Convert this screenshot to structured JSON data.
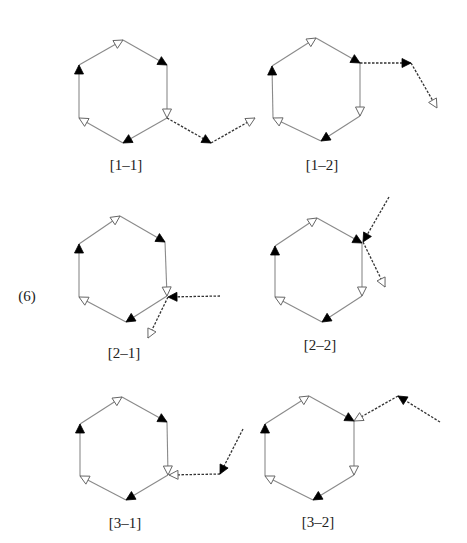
{
  "figure": {
    "equation_number": "(6)",
    "equation_number_pos": [
      27,
      296
    ],
    "colors": {
      "ring_edge": "#8a8a8a",
      "side_chain": "#333333",
      "filled_arrow": "#000000",
      "open_arrow_stroke": "#666666",
      "label_text": "#222222"
    },
    "panels": [
      {
        "id": "1-1",
        "label": "[1–1]",
        "label_pos": [
          126,
          165
        ],
        "hexagon": {
          "T": [
            123,
            40
          ],
          "UR": [
            167,
            65
          ],
          "LR": [
            167,
            118
          ],
          "B": [
            123,
            143
          ],
          "LL": [
            79,
            118
          ],
          "UL": [
            79,
            65
          ]
        },
        "side_chain": [
          {
            "from": [
              167,
              118
            ],
            "to": [
              211,
              143
            ],
            "head": "filled"
          },
          {
            "from": [
              211,
              143
            ],
            "to": [
              255,
              118
            ],
            "head": "open"
          }
        ]
      },
      {
        "id": "1-2",
        "label": "[1–2]",
        "label_pos": [
          322,
          165
        ],
        "hexagon": {
          "T": [
            316,
            38
          ],
          "UR": [
            360,
            63
          ],
          "LR": [
            360,
            116
          ],
          "B": [
            321,
            141
          ],
          "LL": [
            273,
            118
          ],
          "UL": [
            272,
            66
          ]
        },
        "side_chain": [
          {
            "from": [
              360,
              63
            ],
            "to": [
              411,
              63
            ],
            "head": "filled"
          },
          {
            "from": [
              411,
              63
            ],
            "to": [
              437,
              108
            ],
            "head": "open"
          }
        ]
      },
      {
        "id": "2-1",
        "label": "[2–1]",
        "label_pos": [
          124,
          353
        ],
        "hexagon": {
          "T": [
            120,
            216
          ],
          "UR": [
            165,
            242
          ],
          "LR": [
            167,
            296
          ],
          "B": [
            126,
            322
          ],
          "LL": [
            79,
            297
          ],
          "UL": [
            79,
            244
          ]
        },
        "side_chain": [
          {
            "from": [
              220,
              296
            ],
            "to": [
              168,
              297
            ],
            "head": "filled"
          },
          {
            "from": [
              168,
              297
            ],
            "to": [
              148,
              338
            ],
            "head": "open"
          }
        ]
      },
      {
        "id": "2-2",
        "label": "[2–2]",
        "label_pos": [
          320,
          345
        ],
        "hexagon": {
          "T": [
            317,
            218
          ],
          "UR": [
            362,
            243
          ],
          "LR": [
            362,
            296
          ],
          "B": [
            322,
            322
          ],
          "LL": [
            275,
            297
          ],
          "UL": [
            275,
            246
          ]
        },
        "side_chain": [
          {
            "from": [
              389,
              197
            ],
            "to": [
              363,
              242
            ],
            "head": "filled"
          },
          {
            "from": [
              363,
              242
            ],
            "to": [
              385,
              287
            ],
            "head": "open"
          }
        ]
      },
      {
        "id": "3-1",
        "label": "[3–1]",
        "label_pos": [
          125,
          523
        ],
        "hexagon": {
          "T": [
            122,
            397
          ],
          "UR": [
            167,
            422
          ],
          "LR": [
            168,
            475
          ],
          "B": [
            126,
            500
          ],
          "LL": [
            80,
            476
          ],
          "UL": [
            80,
            424
          ]
        },
        "side_chain": [
          {
            "from": [
              243,
              429
            ],
            "to": [
              220,
              474
            ],
            "head": "filled"
          },
          {
            "from": [
              220,
              474
            ],
            "to": [
              169,
              475
            ],
            "head": "open"
          }
        ]
      },
      {
        "id": "3-2",
        "label": "[3–2]",
        "label_pos": [
          318,
          522
        ],
        "hexagon": {
          "T": [
            309,
            396
          ],
          "UR": [
            354,
            421
          ],
          "LR": [
            354,
            475
          ],
          "B": [
            313,
            500
          ],
          "LL": [
            265,
            476
          ],
          "UL": [
            265,
            424
          ]
        },
        "side_chain": [
          {
            "from": [
              440,
              422
            ],
            "to": [
              398,
              396
            ],
            "head": "filled"
          },
          {
            "from": [
              398,
              396
            ],
            "to": [
              354,
              421
            ],
            "head": "open"
          }
        ]
      }
    ],
    "ring_edge_heads": [
      {
        "from": "UL",
        "to": "T",
        "head": "open"
      },
      {
        "from": "T",
        "to": "UR",
        "head": "filled"
      },
      {
        "from": "UR",
        "to": "LR",
        "head": "open"
      },
      {
        "from": "LR",
        "to": "B",
        "head": "filled"
      },
      {
        "from": "B",
        "to": "LL",
        "head": "open"
      },
      {
        "from": "LL",
        "to": "UL",
        "head": "filled"
      }
    ]
  }
}
